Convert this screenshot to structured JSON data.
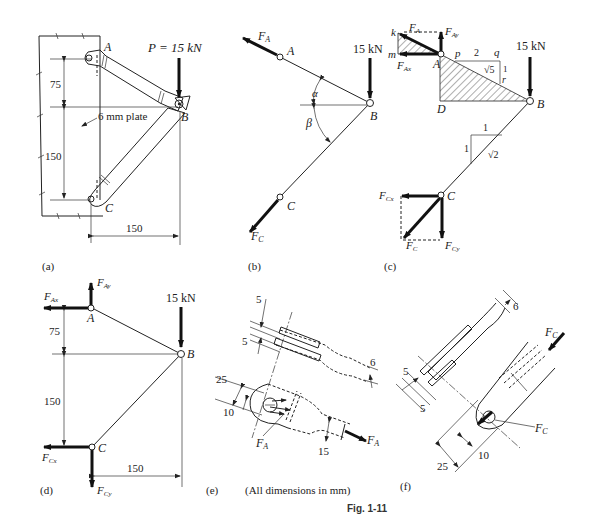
{
  "figure": {
    "caption": "Fig. 1-11",
    "note": "(All dimensions in mm)"
  },
  "panels": {
    "a": {
      "label": "(a)",
      "load": "P = 15 kN",
      "nodes": {
        "A": "A",
        "B": "B",
        "C": "C"
      },
      "plate_note": "6 mm plate",
      "dims": {
        "vertical_upper": "75",
        "vertical_lower": "150",
        "horizontal": "150"
      }
    },
    "b": {
      "label": "(b)",
      "load": "15 kN",
      "forces": {
        "FA": "F",
        "FA_sub": "A",
        "FC": "F",
        "FC_sub": "C"
      },
      "angles": {
        "alpha": "α",
        "beta": "β"
      },
      "nodes": {
        "A": "A",
        "B": "B",
        "C": "C"
      }
    },
    "c": {
      "label": "(c)",
      "load": "15 kN",
      "nodes": {
        "A": "A",
        "B": "B",
        "C": "C",
        "D": "D",
        "k": "k",
        "m": "m",
        "p": "p",
        "q": "q",
        "r": "r"
      },
      "slope_AB": {
        "run": "2",
        "rise": "1",
        "hyp": "√5"
      },
      "slope_BC": {
        "run": "1",
        "rise": "1",
        "hyp": "√2"
      },
      "forces": {
        "FA": "F",
        "FA_sub": "A",
        "FAy": "F",
        "FAy_sub": "Ay",
        "FAx": "F",
        "FAx_sub": "Ax",
        "FCx": "F",
        "FCx_sub": "Cx",
        "FC": "F",
        "FC_sub": "C",
        "FCy": "F",
        "FCy_sub": "Cy"
      }
    },
    "d": {
      "label": "(d)",
      "load": "15 kN",
      "nodes": {
        "A": "A",
        "B": "B",
        "C": "C"
      },
      "dims": {
        "vertical_upper": "75",
        "vertical_lower": "150",
        "horizontal": "150"
      },
      "forces": {
        "FAx": "F",
        "FAx_sub": "Ax",
        "FAy": "F",
        "FAy_sub": "Ay",
        "FCx": "F",
        "FCx_sub": "Cx",
        "FCy": "F",
        "FCy_sub": "Cy"
      }
    },
    "e": {
      "label": "(e)",
      "dims": {
        "slot_a": "5",
        "slot_b": "5",
        "thickness": "6",
        "width": "25",
        "hole": "10",
        "neck": "15"
      },
      "forces": {
        "FA_pin": "F",
        "FA_pin_sub": "A",
        "FA_end": "F",
        "FA_end_sub": "A"
      }
    },
    "f": {
      "label": "(f)",
      "dims": {
        "thickness": "6",
        "slot_a": "5",
        "slot_b": "5",
        "width": "25",
        "hole": "10"
      },
      "forces": {
        "FC_end": "F",
        "FC_end_sub": "C",
        "FC_pin": "F",
        "FC_pin_sub": "C"
      }
    }
  }
}
